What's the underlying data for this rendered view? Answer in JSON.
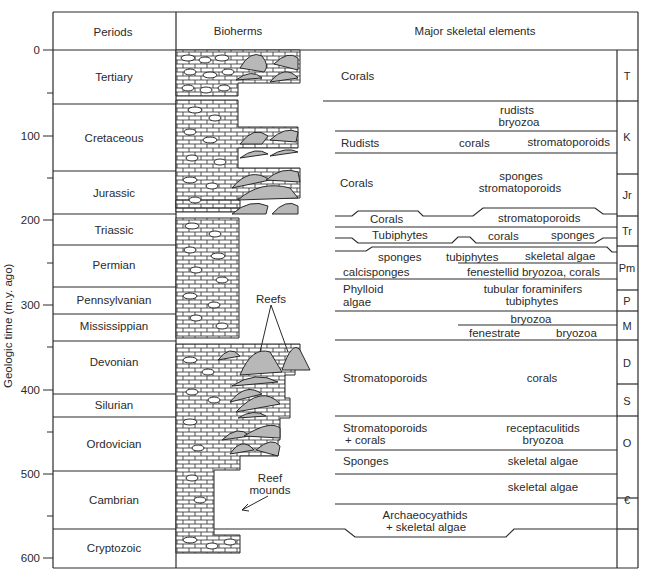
{
  "headers": {
    "periods": "Periods",
    "bioherms": "Bioherms",
    "skeletal": "Major skeletal elements"
  },
  "y_axis": {
    "label": "Geologic time (m.y. ago)",
    "ticks": [
      "0",
      "100",
      "200",
      "300",
      "400",
      "500",
      "600"
    ]
  },
  "periods": [
    {
      "name": "Tertiary",
      "symbol": "T"
    },
    {
      "name": "Cretaceous",
      "symbol": "K"
    },
    {
      "name": "Jurassic",
      "symbol": "Jr"
    },
    {
      "name": "Triassic",
      "symbol": "Tr"
    },
    {
      "name": "Permian",
      "symbol": "Pm"
    },
    {
      "name": "Pennsylvanian",
      "symbol": "P"
    },
    {
      "name": "Mississippian",
      "symbol": "M"
    },
    {
      "name": "Devonian",
      "symbol": "D"
    },
    {
      "name": "Silurian",
      "symbol": "S"
    },
    {
      "name": "Ordovician",
      "symbol": "O"
    },
    {
      "name": "Cambrian",
      "symbol": "€"
    },
    {
      "name": "Cryptozoic",
      "symbol": ""
    }
  ],
  "annotations": {
    "reefs": "Reefs",
    "reef_mounds_1": "Reef",
    "reef_mounds_2": "mounds"
  },
  "skeletal": {
    "tertiary_corals": "Corals",
    "k_rudists_upper": "rudists",
    "k_bryozoa_upper": "bryozoa",
    "k_rudists": "Rudists",
    "k_corals": "corals",
    "k_stromatoporoids": "stromatoporoids",
    "j_corals": "Corals",
    "j_sponges": "sponges",
    "j_stromatoporoids": "stromatoporoids",
    "tr_corals": "Corals",
    "tr_stromatoporoids": "stromatoporoids",
    "tr_tubiphytes": "Tubiphytes",
    "tr_corals2": "corals",
    "tr_sponges": "sponges",
    "pm_sponges": "sponges",
    "pm_tubiphytes": "tubiphytes",
    "pm_skeletal_algae": "skeletal algae",
    "pm_calcisponges": "calcisponges",
    "pm_fenestellid": "fenestellid bryozoa, corals",
    "p_phylloid_1": "Phylloid",
    "p_phylloid_2": "algae",
    "p_tubular": "tubular foraminifers",
    "p_tubiphytes": "tubiphytes",
    "m_bryozoa": "bryozoa",
    "m_fenestrate": "fenestrate",
    "m_bryozoa2": "bryozoa",
    "ds_stromatoporoids": "Stromatoporoids",
    "ds_corals": "corals",
    "o_stromatoporoids": "Stromatoporoids",
    "o_plus_corals": "+ corals",
    "o_receptaculitids": "receptaculitids",
    "o_bryozoa": "bryozoa",
    "o_sponges": "Sponges",
    "o_skeletal_algae": "skeletal algae",
    "c_skeletal_algae": "skeletal algae",
    "c_archaeocyathids": "Archaeocyathids",
    "c_plus_algae": "+ skeletal algae"
  },
  "colors": {
    "line": "#2a2a2a",
    "reef_fill": "#b8b8b8",
    "background": "#ffffff"
  }
}
